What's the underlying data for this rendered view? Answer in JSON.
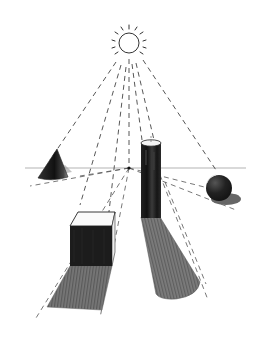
{
  "illustration": {
    "subject": "Pencil sketch: sun casting light on geometric solids with shadows in perspective",
    "elements": [
      "sun",
      "horizon-line",
      "vanishing-point",
      "cone",
      "cylinder",
      "sphere",
      "cube",
      "light-rays",
      "shadows"
    ],
    "colors": {
      "background": "#ffffff",
      "ink": "#1a1a1a",
      "dark_fill": "#1e1e1e",
      "shadow_mid": "#6e6e6e",
      "shadow_light": "#9a9a9a",
      "line_gray": "#555555"
    }
  }
}
